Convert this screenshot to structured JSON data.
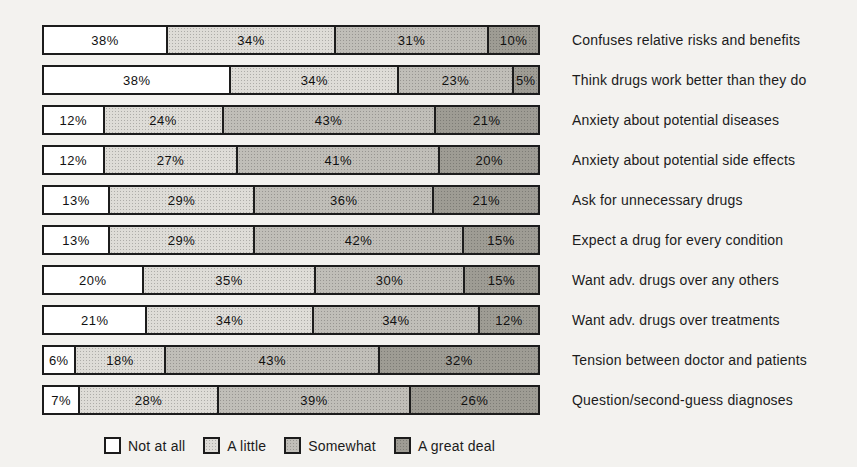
{
  "chart_data": {
    "type": "bar",
    "subtype": "horizontal-stacked-100pct",
    "title": "",
    "xlabel": "",
    "ylabel": "",
    "grid": false,
    "legend_position": "bottom",
    "bar_border_color": "#1c1c1c",
    "background_color": "#f3f2ef",
    "legend": [
      {
        "label": "Not at all",
        "color": "#ffffff"
      },
      {
        "label": "A little",
        "color": "#dedcd7"
      },
      {
        "label": "Somewhat",
        "color": "#c0beb8"
      },
      {
        "label": "A great deal",
        "color": "#9e9c94"
      }
    ],
    "rows": [
      {
        "category": "Confuses relative risks and benefits",
        "values": [
          38,
          34,
          31,
          10
        ],
        "labels": [
          "38%",
          "34%",
          "31%",
          "10%"
        ],
        "widths": [
          25,
          34,
          31,
          10
        ]
      },
      {
        "category": "Think drugs work better than they do",
        "values": [
          38,
          34,
          23,
          5
        ],
        "labels": [
          "38%",
          "34%",
          "23%",
          "5%"
        ],
        "widths": [
          38,
          34,
          23,
          5
        ]
      },
      {
        "category": "Anxiety about potential diseases",
        "values": [
          12,
          24,
          43,
          21
        ],
        "labels": [
          "12%",
          "24%",
          "43%",
          "21%"
        ],
        "widths": [
          12,
          24,
          43,
          21
        ]
      },
      {
        "category": "Anxiety about potential side effects",
        "values": [
          12,
          27,
          41,
          20
        ],
        "labels": [
          "12%",
          "27%",
          "41%",
          "20%"
        ],
        "widths": [
          12,
          27,
          41,
          20
        ]
      },
      {
        "category": "Ask for unnecessary drugs",
        "values": [
          13,
          29,
          36,
          21
        ],
        "labels": [
          "13%",
          "29%",
          "36%",
          "21%"
        ],
        "widths": [
          13,
          29,
          36,
          21
        ]
      },
      {
        "category": "Expect a drug for every condition",
        "values": [
          13,
          29,
          42,
          15
        ],
        "labels": [
          "13%",
          "29%",
          "42%",
          "15%"
        ],
        "widths": [
          13,
          29,
          42,
          15
        ]
      },
      {
        "category": "Want adv. drugs over any others",
        "values": [
          20,
          35,
          30,
          15
        ],
        "labels": [
          "20%",
          "35%",
          "30%",
          "15%"
        ],
        "widths": [
          20,
          35,
          30,
          15
        ]
      },
      {
        "category": "Want adv. drugs over treatments",
        "values": [
          21,
          34,
          34,
          12
        ],
        "labels": [
          "21%",
          "34%",
          "34%",
          "12%"
        ],
        "widths": [
          21,
          34,
          34,
          12
        ]
      },
      {
        "category": "Tension between doctor and patients",
        "values": [
          6,
          18,
          43,
          32
        ],
        "labels": [
          "6%",
          "18%",
          "43%",
          "32%"
        ],
        "widths": [
          6,
          18,
          43,
          32
        ]
      },
      {
        "category": "Question/second-guess diagnoses",
        "values": [
          7,
          28,
          39,
          26
        ],
        "labels": [
          "7%",
          "28%",
          "39%",
          "26%"
        ],
        "widths": [
          7,
          28,
          39,
          26
        ]
      }
    ]
  }
}
